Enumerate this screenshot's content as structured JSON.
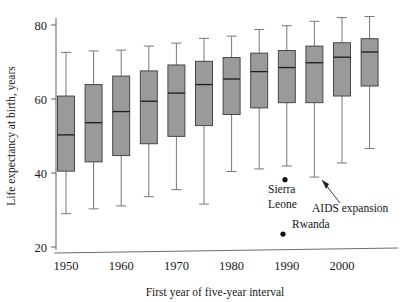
{
  "chart_data": {
    "type": "box",
    "title": "",
    "xlabel": "First year of five-year interval",
    "ylabel": "Life expectancy at birth, years",
    "ylim": [
      18,
      82
    ],
    "yticks": [
      20,
      40,
      60,
      80
    ],
    "ytick_labels": [
      "20",
      "40",
      "60",
      "80"
    ],
    "xticks": [
      1950,
      1960,
      1970,
      1980,
      1990,
      2000
    ],
    "xtick_labels": [
      "1950",
      "1960",
      "1970",
      "1980",
      "1990",
      "2000"
    ],
    "grid": false,
    "legend": "none",
    "categories": [
      1950,
      1955,
      1960,
      1965,
      1970,
      1975,
      1980,
      1985,
      1990,
      1995,
      2000,
      2005
    ],
    "boxes": [
      {
        "x": 1950,
        "whisker_low": 29.0,
        "q1": 40.5,
        "median": 50.3,
        "q3": 60.8,
        "whisker_high": 72.6
      },
      {
        "x": 1955,
        "whisker_low": 30.3,
        "q1": 43.0,
        "median": 53.6,
        "q3": 63.9,
        "whisker_high": 73.0
      },
      {
        "x": 1960,
        "whisker_low": 31.1,
        "q1": 44.7,
        "median": 56.6,
        "q3": 66.2,
        "whisker_high": 73.2
      },
      {
        "x": 1965,
        "whisker_low": 33.6,
        "q1": 47.9,
        "median": 59.4,
        "q3": 67.6,
        "whisker_high": 74.3
      },
      {
        "x": 1970,
        "whisker_low": 35.5,
        "q1": 49.9,
        "median": 61.6,
        "q3": 69.2,
        "whisker_high": 75.1
      },
      {
        "x": 1975,
        "whisker_low": 31.6,
        "q1": 52.8,
        "median": 63.9,
        "q3": 70.2,
        "whisker_high": 76.4
      },
      {
        "x": 1980,
        "whisker_low": 40.4,
        "q1": 55.8,
        "median": 65.4,
        "q3": 71.2,
        "whisker_high": 77.0
      },
      {
        "x": 1985,
        "whisker_low": 41.1,
        "q1": 57.6,
        "median": 67.4,
        "q3": 72.4,
        "whisker_high": 78.8
      },
      {
        "x": 1990,
        "whisker_low": 41.9,
        "q1": 59.0,
        "median": 68.5,
        "q3": 73.1,
        "whisker_high": 79.8
      },
      {
        "x": 1995,
        "whisker_low": 38.9,
        "q1": 59.0,
        "median": 69.8,
        "q3": 74.3,
        "whisker_high": 81.0
      },
      {
        "x": 2000,
        "whisker_low": 42.7,
        "q1": 60.8,
        "median": 71.3,
        "q3": 75.2,
        "whisker_high": 82.0
      },
      {
        "x": 2005,
        "whisker_low": 46.6,
        "q1": 63.5,
        "median": 72.7,
        "q3": 76.3,
        "whisker_high": 82.3
      }
    ],
    "outliers": [
      {
        "label": "Sierra Leone",
        "x": 1990,
        "y": 38.2
      },
      {
        "label": "Rwanda",
        "x": 1990,
        "y": 23.5
      }
    ],
    "annotations": [
      {
        "text": "Sierra",
        "x": 1990,
        "y": 34.5
      },
      {
        "text": "Leone",
        "x": 1990,
        "y": 29.8
      },
      {
        "text": "AIDS expansion",
        "x": 1997,
        "y": 28.5
      },
      {
        "text": "Rwanda",
        "x": 1992,
        "y": 23.5
      }
    ],
    "colors": {
      "box_fill": "#9a9a9a",
      "box_edge": "#3b3b3b",
      "median": "#1c1c1c",
      "whisker": "#777777",
      "axis": "#6d6d6d",
      "text": "#1a1a1a",
      "outlier": "#111111",
      "background": "#ffffff"
    }
  }
}
